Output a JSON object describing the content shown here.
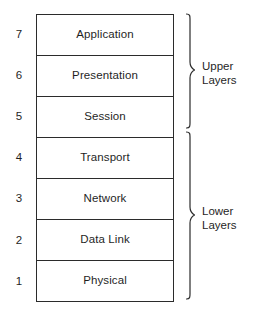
{
  "diagram": {
    "line_color": "#2b2b2b",
    "text_color": "#1f1f1f",
    "background": "#ffffff",
    "layers": [
      {
        "number": "7",
        "name": "Application"
      },
      {
        "number": "6",
        "name": "Presentation"
      },
      {
        "number": "5",
        "name": "Session"
      },
      {
        "number": "4",
        "name": "Transport"
      },
      {
        "number": "3",
        "name": "Network"
      },
      {
        "number": "2",
        "name": "Data Link"
      },
      {
        "number": "1",
        "name": "Physical"
      }
    ],
    "groups": [
      {
        "label": "Upper\nLayers",
        "covers": [
          "7",
          "6",
          "5"
        ]
      },
      {
        "label": "Lower\nLayers",
        "covers": [
          "4",
          "3",
          "2",
          "1"
        ]
      }
    ]
  }
}
